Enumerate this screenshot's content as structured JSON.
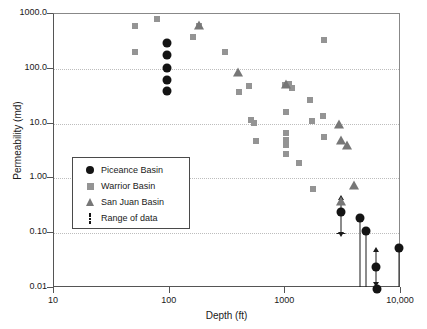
{
  "chart_data": {
    "type": "scatter",
    "title": "",
    "xlabel": "Depth (ft)",
    "ylabel": "Permeability (md)",
    "xscale": "log",
    "yscale": "log",
    "xlim": [
      10,
      10000
    ],
    "ylim": [
      0.01,
      1000
    ],
    "grid": true,
    "grid_axis": "y",
    "xticks": [
      10,
      100,
      1000,
      10000
    ],
    "xtick_labels": [
      "10",
      "100",
      "1000",
      "10,000"
    ],
    "yticks": [
      0.01,
      0.1,
      1,
      10,
      100,
      1000
    ],
    "ytick_labels": [
      "0.01",
      "0.10",
      "1.00",
      "10.0",
      "100.0",
      "1000.0"
    ],
    "legend_position": "lower-left-inside",
    "series": [
      {
        "name": "Piceance Basin",
        "marker": "circle",
        "color": "#141414",
        "points": [
          {
            "x": 95,
            "y": 300
          },
          {
            "x": 95,
            "y": 175
          },
          {
            "x": 95,
            "y": 105
          },
          {
            "x": 95,
            "y": 62
          },
          {
            "x": 95,
            "y": 40
          },
          {
            "x": 3050,
            "y": 0.24
          },
          {
            "x": 4400,
            "y": 0.19
          },
          {
            "x": 4950,
            "y": 0.11
          },
          {
            "x": 6100,
            "y": 0.024
          },
          {
            "x": 6200,
            "y": 0.0095
          },
          {
            "x": 9700,
            "y": 0.053
          }
        ]
      },
      {
        "name": "Warrior Basin",
        "marker": "square",
        "color": "#949494",
        "points": [
          {
            "x": 50,
            "y": 610
          },
          {
            "x": 50,
            "y": 205
          },
          {
            "x": 78,
            "y": 820
          },
          {
            "x": 160,
            "y": 380
          },
          {
            "x": 180,
            "y": 610
          },
          {
            "x": 300,
            "y": 200
          },
          {
            "x": 400,
            "y": 38
          },
          {
            "x": 490,
            "y": 49
          },
          {
            "x": 500,
            "y": 11.5
          },
          {
            "x": 540,
            "y": 10.2
          },
          {
            "x": 560,
            "y": 4.8
          },
          {
            "x": 1000,
            "y": 50
          },
          {
            "x": 1010,
            "y": 16
          },
          {
            "x": 1020,
            "y": 6.6
          },
          {
            "x": 1020,
            "y": 5.1
          },
          {
            "x": 1020,
            "y": 4.0
          },
          {
            "x": 1020,
            "y": 2.8
          },
          {
            "x": 1080,
            "y": 53
          },
          {
            "x": 1150,
            "y": 45
          },
          {
            "x": 1300,
            "y": 1.9
          },
          {
            "x": 1650,
            "y": 27
          },
          {
            "x": 1700,
            "y": 11.0
          },
          {
            "x": 1750,
            "y": 0.65
          },
          {
            "x": 2150,
            "y": 340
          },
          {
            "x": 2100,
            "y": 14
          },
          {
            "x": 2150,
            "y": 5.6
          }
        ]
      },
      {
        "name": "San Juan Basin",
        "marker": "triangle",
        "color": "#777777",
        "points": [
          {
            "x": 180,
            "y": 640
          },
          {
            "x": 390,
            "y": 88
          },
          {
            "x": 1010,
            "y": 52
          },
          {
            "x": 2900,
            "y": 10.0
          },
          {
            "x": 3050,
            "y": 5.0
          },
          {
            "x": 3400,
            "y": 4.1
          },
          {
            "x": 3900,
            "y": 0.75
          },
          {
            "x": 3050,
            "y": 0.39
          }
        ]
      }
    ],
    "range_bars": [
      {
        "x": 3050,
        "y_low": 0.1,
        "y_high": 0.42,
        "upper_arrow": true,
        "lower_cap": true
      },
      {
        "x": 4400,
        "y_low": 0.0105,
        "y_high": 0.19,
        "upper_arrow": false,
        "lower_cap": false
      },
      {
        "x": 4950,
        "y_low": 0.0105,
        "y_high": 0.11,
        "upper_arrow": false,
        "lower_cap": false
      },
      {
        "x": 6100,
        "y_low": 0.0125,
        "y_high": 0.047,
        "upper_arrow": true,
        "lower_cap": false
      },
      {
        "x": 9700,
        "y_low": 0.0105,
        "y_high": 0.053,
        "upper_arrow": false,
        "lower_cap": false
      }
    ]
  },
  "legend": {
    "items": [
      {
        "label": "Piceance Basin",
        "marker": "circle"
      },
      {
        "label": "Warrior Basin",
        "marker": "square"
      },
      {
        "label": "San Juan Basin",
        "marker": "triangle"
      },
      {
        "label": "Range of data",
        "marker": "range"
      }
    ]
  }
}
